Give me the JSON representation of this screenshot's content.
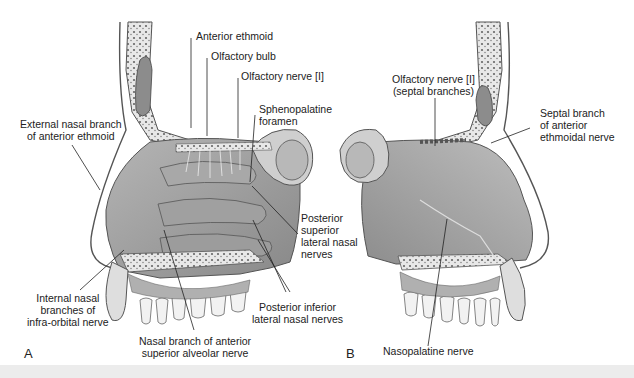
{
  "figure": {
    "panels": [
      {
        "id": "A",
        "label": "A"
      },
      {
        "id": "B",
        "label": "B"
      }
    ],
    "labels_a": {
      "anterior_ethmoid": "Anterior ethmoid",
      "olfactory_bulb": "Olfactory bulb",
      "olfactory_nerve": "Olfactory nerve [I]",
      "sphenopalatine_1": "Sphenopalatine",
      "sphenopalatine_2": "foramen",
      "external_nasal_1": "External nasal branch",
      "external_nasal_2": "of anterior ethmoid",
      "post_sup_1": "Posterior",
      "post_sup_2": "superior",
      "post_sup_3": "lateral nasal",
      "post_sup_4": "nerves",
      "internal_nasal_1": "Internal nasal",
      "internal_nasal_2": "branches of",
      "internal_nasal_3": "infra-orbital nerve",
      "post_inf_1": "Posterior inferior",
      "post_inf_2": "lateral nasal nerves",
      "nasal_branch_1": "Nasal branch of anterior",
      "nasal_branch_2": "superior alveolar nerve"
    },
    "labels_b": {
      "olfactory_septal_1": "Olfactory nerve [I]",
      "olfactory_septal_2": "(septal branches)",
      "septal_branch_1": "Septal branch",
      "septal_branch_2": "of anterior",
      "septal_branch_3": "ethmoidal nerve",
      "nasopalatine": "Nasopalatine nerve"
    },
    "colors": {
      "tissue": "#9a9a9a",
      "tissue_light": "#c4c4c4",
      "bone": "#e6e6e6",
      "outline": "#555555",
      "leader": "#222222",
      "strip": "#ececec"
    }
  }
}
